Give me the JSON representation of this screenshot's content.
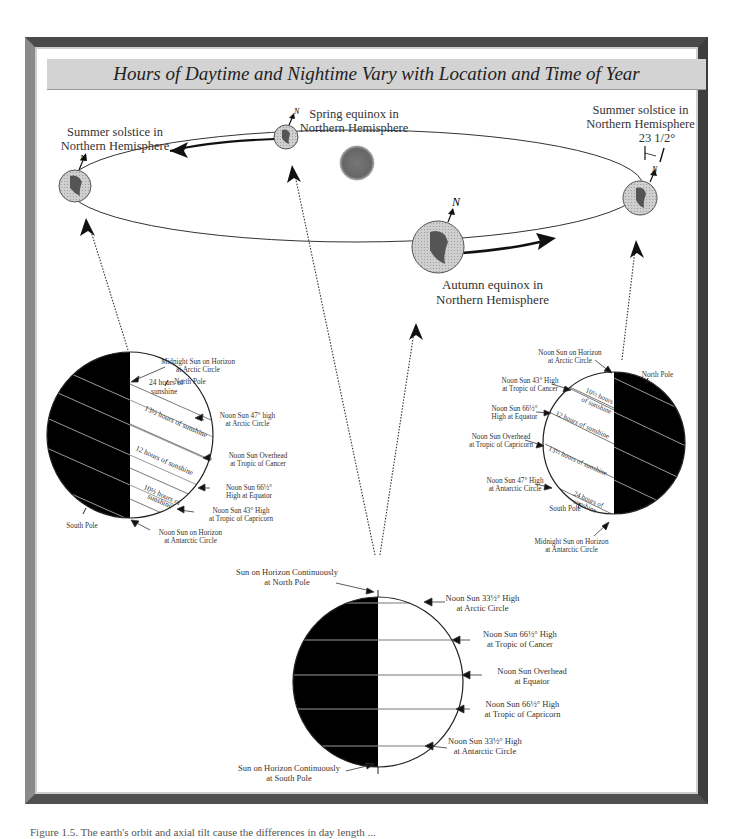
{
  "title": "Hours of Daytime and Nightime Vary with Location and Time of Year",
  "orbit": {
    "summer_solstice_left": [
      "Summer solstice in",
      "Northern Hemisphere"
    ],
    "spring_equinox": [
      "Spring equinox in",
      "Northern Hemisphere"
    ],
    "summer_solstice_right": [
      "Summer solstice in",
      "Northern Hemisphere"
    ],
    "autumn_equinox": [
      "Autumn equinox in",
      "Northern Hemisphere"
    ],
    "tilt_label": "23 1/2°",
    "north_marker": "N"
  },
  "left_globe": {
    "labels": {
      "midnight_sun": [
        "Midnight Sun on Horizon",
        "at Arctic Circle"
      ],
      "north_pole": "North Pole",
      "south_pole": "South Pole",
      "noon_47": [
        "Noon Sun 47° high",
        "at Arctic Circle"
      ],
      "noon_overhead": [
        "Noon Sun Overhead",
        "at Tropic of Cancer"
      ],
      "noon_66": [
        "Noon Sun 66½°",
        "High at Equator"
      ],
      "noon_43": [
        "Noon Sun 43° High",
        "at Tropic of Capricorn"
      ],
      "noon_horizon": [
        "Noon Sun on Horizon",
        "at Antarctic Circle"
      ]
    },
    "bands": [
      "24 hours of sunshine",
      "13½ hours of sunshine",
      "12 hours of sunshine",
      "10½ hours of sunshine"
    ]
  },
  "right_globe": {
    "labels": {
      "noon_horizon": [
        "Noon Sun on Horizon",
        "at Arctic Circle"
      ],
      "north_pole": "North Pole",
      "south_pole": "South Pole",
      "noon_43": [
        "Noon Sun 43° High",
        "at Tropic of Cancer"
      ],
      "noon_66": [
        "Noon Sun 66½°",
        "High at Equator"
      ],
      "noon_overhead": [
        "Noon Sun Overhead",
        "at Tropic of Capricorn"
      ],
      "noon_47": [
        "Noon Sun 47° High",
        "at Antarctic Circle"
      ],
      "midnight_sun": [
        "Midnight Sun on Horizon",
        "at Antarctic Circle"
      ]
    },
    "bands": [
      "10½ hours of sunshine",
      "12 hours of sunshine",
      "13½ hours of sunshine",
      "24 hours of sunshine"
    ]
  },
  "bottom_globe": {
    "labels": {
      "north_pole": [
        "Sun on Horizon Continuously",
        "at North Pole"
      ],
      "arctic": [
        "Noon Sun 33½° High",
        "at Arctic Circle"
      ],
      "cancer": [
        "Noon Sun 66½° High",
        "at Tropic of Cancer"
      ],
      "equator": [
        "Noon Sun Overhead",
        "at Equator"
      ],
      "capricorn": [
        "Noon Sun 66½° High",
        "at Tropic of Capricorn"
      ],
      "antarctic": [
        "Noon Sun 33½° High",
        "at Antarctic Circle"
      ],
      "south_pole": [
        "Sun on Horizon Continuously",
        "at South Pole"
      ]
    }
  },
  "caption": "Figure 1.5. The earth's orbit and axial tilt cause the differences in day length ..."
}
